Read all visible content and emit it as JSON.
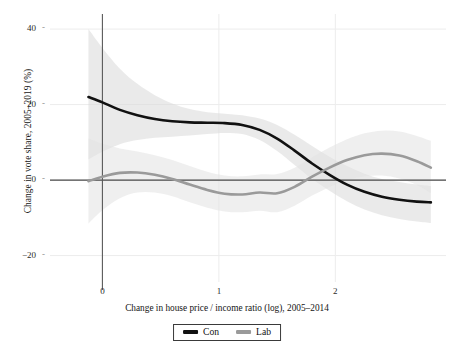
{
  "chart_data": {
    "type": "line",
    "title": "",
    "xlabel": "Change in house price / income ratio (log), 2005–2014",
    "ylabel": "Change in vote share, 2005–2019 (%)",
    "xlim": [
      -0.45,
      2.95
    ],
    "ylim": [
      -27,
      44
    ],
    "xticks": [
      0,
      1,
      2
    ],
    "xticklabels": [
      "0",
      "1",
      "2"
    ],
    "yticks": [
      -20,
      0,
      20,
      40
    ],
    "yticklabels": [
      "−20",
      "0",
      "20",
      "40"
    ],
    "grid": true,
    "grid_style": "light gray gridlines at y ticks and x ticks",
    "legend_position": "bottom-center, boxed",
    "reference_lines": [
      {
        "axis": "y",
        "value": 0,
        "color": "#4a4a4a"
      },
      {
        "axis": "x",
        "value": 0,
        "color": "#5a5a5a"
      }
    ],
    "series": [
      {
        "name": "Con",
        "label": "Con",
        "color": "#111111",
        "linewidth": 2.6,
        "band_color": "#d9d9d9",
        "x": [
          -0.12,
          0.0,
          0.15,
          0.3,
          0.45,
          0.6,
          0.75,
          0.9,
          1.05,
          1.2,
          1.35,
          1.5,
          1.65,
          1.8,
          1.95,
          2.1,
          2.25,
          2.4,
          2.55,
          2.7,
          2.82
        ],
        "y": [
          22.0,
          20.6,
          18.6,
          17.2,
          16.2,
          15.6,
          15.3,
          15.2,
          15.1,
          14.6,
          13.3,
          11.0,
          7.8,
          4.4,
          1.4,
          -1.2,
          -3.1,
          -4.4,
          -5.2,
          -5.7,
          -5.9
        ],
        "band_upper": [
          40.0,
          35.0,
          29.5,
          25.5,
          22.5,
          20.3,
          18.8,
          18.0,
          17.6,
          17.2,
          16.3,
          14.6,
          12.0,
          9.0,
          6.2,
          3.7,
          1.7,
          0.3,
          -0.5,
          -1.2,
          -1.6
        ],
        "band_lower": [
          5.5,
          7.5,
          9.5,
          10.6,
          11.2,
          11.5,
          11.8,
          12.2,
          12.5,
          12.2,
          10.6,
          7.7,
          4.0,
          0.3,
          -2.8,
          -5.6,
          -7.8,
          -9.3,
          -10.3,
          -11.0,
          -11.4
        ]
      },
      {
        "name": "Lab",
        "label": "Lab",
        "color": "#9a9a9a",
        "linewidth": 2.6,
        "band_color": "#e2e2e2",
        "x": [
          -0.12,
          0.0,
          0.15,
          0.3,
          0.45,
          0.6,
          0.75,
          0.9,
          1.05,
          1.2,
          1.35,
          1.5,
          1.65,
          1.8,
          1.95,
          2.1,
          2.25,
          2.4,
          2.55,
          2.7,
          2.82
        ],
        "y": [
          -0.3,
          0.9,
          1.9,
          2.0,
          1.4,
          0.3,
          -1.2,
          -2.6,
          -3.6,
          -3.8,
          -3.3,
          -3.5,
          -1.8,
          0.9,
          3.3,
          5.3,
          6.6,
          7.0,
          6.5,
          5.0,
          3.3
        ],
        "band_upper": [
          11.0,
          9.6,
          8.4,
          7.6,
          6.6,
          5.3,
          3.7,
          2.2,
          1.2,
          1.0,
          1.5,
          1.6,
          3.3,
          6.0,
          8.6,
          10.8,
          12.4,
          13.1,
          12.9,
          11.7,
          10.4
        ],
        "band_lower": [
          -11.5,
          -8.0,
          -4.8,
          -3.3,
          -3.3,
          -4.3,
          -5.9,
          -7.3,
          -8.3,
          -8.5,
          -8.1,
          -8.5,
          -6.8,
          -4.1,
          -1.8,
          0.0,
          1.0,
          1.2,
          0.4,
          -1.3,
          -3.4
        ]
      }
    ]
  },
  "legend": {
    "items": [
      {
        "label": "Con",
        "color": "#111111"
      },
      {
        "label": "Lab",
        "color": "#9a9a9a"
      }
    ]
  }
}
